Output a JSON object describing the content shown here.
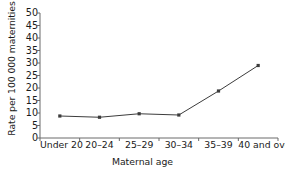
{
  "chart_data": {
    "type": "line",
    "title": "",
    "xlabel": "Maternal age",
    "ylabel": "Rate per 100 000 maternities",
    "categories": [
      "Under 20",
      "20–24",
      "25–29",
      "30–34",
      "35–39",
      "40 and over"
    ],
    "values": [
      8.8,
      8.3,
      9.7,
      9.2,
      18.8,
      29.0
    ],
    "ylim": [
      0,
      50
    ],
    "yticks": [
      0,
      5,
      10,
      15,
      20,
      25,
      30,
      35,
      40,
      45,
      50
    ],
    "ytick_labels": [
      "0",
      "5",
      "10",
      "15",
      "20",
      "25",
      "30",
      "35",
      "40",
      "45",
      "50"
    ],
    "grid": false,
    "legend": false,
    "series": [
      {
        "name": "Maternal mortality rate",
        "values": [
          8.8,
          8.3,
          9.7,
          9.2,
          18.8,
          29.0
        ],
        "color": "#3c3c3c",
        "marker": "square"
      }
    ],
    "line_color": "#3c3c3c",
    "axis_color": "#6b6b6b",
    "background": "#ffffff"
  }
}
